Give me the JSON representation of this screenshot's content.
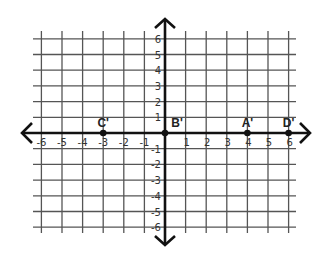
{
  "diagram": {
    "type": "coordinate-plane",
    "x_range": [
      -6,
      6
    ],
    "y_range": [
      -6,
      6
    ],
    "x_tick_labels": [
      "-6",
      "-5",
      "-4",
      "-3",
      "-2",
      "-1",
      "1",
      "2",
      "3",
      "4",
      "5",
      "6"
    ],
    "y_tick_labels": [
      "6",
      "5",
      "4",
      "3",
      "2",
      "1",
      "-1",
      "-2",
      "-3",
      "-4",
      "-5",
      "-6"
    ],
    "points": [
      {
        "label": "C'",
        "x": -3,
        "y": 0
      },
      {
        "label": "B'",
        "x": 0,
        "y": 0
      },
      {
        "label": "A'",
        "x": 4,
        "y": 0
      },
      {
        "label": "D'",
        "x": 6,
        "y": 0
      }
    ],
    "colors": {
      "grid": "#555555",
      "axis": "#111111",
      "background": "#ffffff"
    }
  }
}
